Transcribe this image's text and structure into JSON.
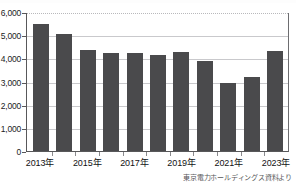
{
  "chart_data": {
    "type": "bar",
    "title": "",
    "xlabel": "",
    "ylabel": "",
    "categories": [
      "2013年",
      "2014年",
      "2015年",
      "2016年",
      "2017年",
      "2018年",
      "2019年",
      "2020年",
      "2021年",
      "2022年",
      "2023年"
    ],
    "values": [
      5500,
      5050,
      4380,
      4210,
      4230,
      4130,
      4260,
      3880,
      2940,
      3180,
      4330
    ],
    "ylim": [
      0,
      6000
    ],
    "y_ticks": [
      0,
      1000,
      2000,
      3000,
      4000,
      5000,
      6000
    ],
    "y_tick_labels": [
      "0",
      "1,000",
      "2,000",
      "3,000",
      "4,000",
      "5,000",
      "6,000"
    ],
    "x_tick_labels_shown": [
      "2013年",
      "2015年",
      "2017年",
      "2019年",
      "2021年",
      "2023年"
    ],
    "x_tick_label_indices": [
      0,
      2,
      4,
      6,
      8,
      10
    ],
    "grid": true,
    "legend": null,
    "bar_color": "#4a4a4c",
    "grid_color": "#c9c9cc",
    "axis_color": "#58585a"
  },
  "source_note": "東京電力ホールディングス資料より"
}
